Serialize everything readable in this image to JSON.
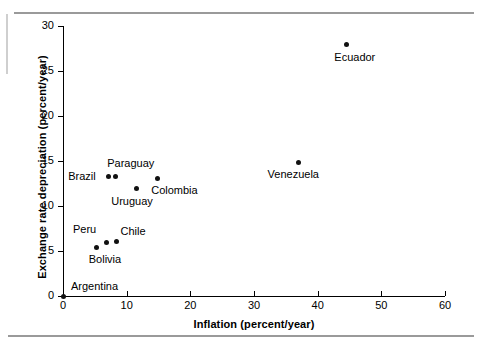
{
  "figure": {
    "background_color": "#ffffff",
    "point_color": "#111111",
    "axis_color": "#000000",
    "rule_color": "#9a9a9a"
  },
  "chart_data": {
    "type": "scatter",
    "title": "",
    "xlabel": "Inflation (percent/year)",
    "ylabel": "Exchange rate depreciation (percent/year)",
    "xlim": [
      0,
      60
    ],
    "ylim": [
      0,
      30
    ],
    "grid": false,
    "legend": "none",
    "xticks": [
      0,
      10,
      20,
      30,
      40,
      50,
      60
    ],
    "yticks": [
      0,
      5,
      10,
      15,
      20,
      25,
      30
    ],
    "xticklabels": [
      "0",
      "10",
      "20",
      "30",
      "40",
      "50",
      "60"
    ],
    "yticklabels": [
      "0",
      "5",
      "10",
      "15",
      "20",
      "25",
      "30"
    ],
    "points": [
      {
        "name": "Argentina",
        "x": 0.0,
        "y": 0.0,
        "label": "Argentina",
        "label_dx": 8,
        "label_dy": -16
      },
      {
        "name": "Bolivia",
        "x": 5.3,
        "y": 5.4,
        "label": "Bolivia",
        "label_dx": -8,
        "label_dy": 6
      },
      {
        "name": "Peru",
        "x": 6.9,
        "y": 6.0,
        "label": "Peru",
        "label_dx": -34,
        "label_dy": -19
      },
      {
        "name": "Chile",
        "x": 8.4,
        "y": 6.1,
        "label": "Chile",
        "label_dx": 4,
        "label_dy": -16
      },
      {
        "name": "Brazil",
        "x": 7.1,
        "y": 13.3,
        "label": "Brazil",
        "label_dx": -40,
        "label_dy": -6
      },
      {
        "name": "Paraguay",
        "x": 8.2,
        "y": 13.3,
        "label": "Paraguay",
        "label_dx": -8,
        "label_dy": -19
      },
      {
        "name": "Uruguay",
        "x": 11.5,
        "y": 11.9,
        "label": "Uruguay",
        "label_dx": -25,
        "label_dy": 6
      },
      {
        "name": "Colombia",
        "x": 14.8,
        "y": 13.1,
        "label": "Colombia",
        "label_dx": -6,
        "label_dy": 6
      },
      {
        "name": "Venezuela",
        "x": 37.0,
        "y": 14.8,
        "label": "Venezuela",
        "label_dx": -31,
        "label_dy": 5
      },
      {
        "name": "Ecuador",
        "x": 44.5,
        "y": 27.9,
        "label": "Ecuador",
        "label_dx": -12,
        "label_dy": 6
      }
    ]
  }
}
